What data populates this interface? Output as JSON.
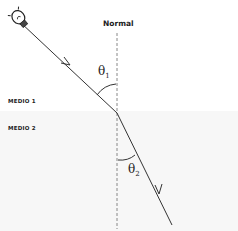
{
  "diagram": {
    "normal_label": "Normal",
    "medium_top_label": "MEDIO 1",
    "medium_bottom_label": "MEDIO 2",
    "angle_incidence": {
      "symbol": "θ",
      "subscript": "1"
    },
    "angle_refraction": {
      "symbol": "θ",
      "subscript": "2"
    },
    "source_icon": "light-bulb-icon",
    "colors": {
      "line": "#333333",
      "normal_line": "#888888",
      "medium_bottom_bg": "#f7f7f7"
    }
  }
}
